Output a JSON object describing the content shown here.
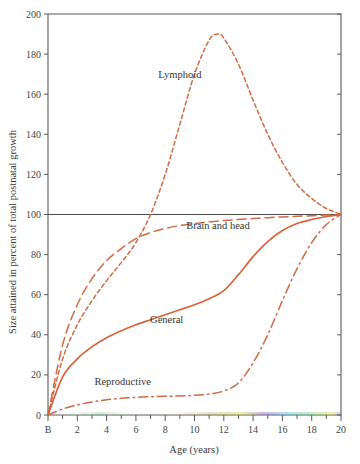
{
  "chart_data": {
    "type": "line",
    "title": "",
    "xlabel": "Age (years)",
    "ylabel": "Size attained in percent of total postnatal growth",
    "xlim": [
      0,
      20
    ],
    "ylim": [
      0,
      200
    ],
    "grid": false,
    "legend_position": "inline-labels",
    "x_tick_labels": [
      "B",
      "2",
      "4",
      "6",
      "8",
      "10",
      "12",
      "14",
      "16",
      "18",
      "20"
    ],
    "x_tick_values": [
      0,
      2,
      4,
      6,
      8,
      10,
      12,
      14,
      16,
      18,
      20
    ],
    "x_minor_tick_values": [
      1,
      3,
      5,
      7,
      9,
      11,
      13,
      15,
      17,
      19
    ],
    "y_tick_labels": [
      "0",
      "20",
      "40",
      "60",
      "80",
      "100",
      "120",
      "140",
      "160",
      "180",
      "200"
    ],
    "y_tick_values": [
      0,
      20,
      40,
      60,
      80,
      100,
      120,
      140,
      160,
      180,
      200
    ],
    "reference_line": {
      "y": 100,
      "style": "solid-dark",
      "label": ""
    },
    "series": [
      {
        "name": "Lymphoid",
        "label": "Lymphoid",
        "color": "#cf6a43",
        "dash": "short-dash",
        "x": [
          0,
          1,
          2,
          3,
          4,
          5,
          6,
          7,
          8,
          9,
          10,
          11,
          11.6,
          12,
          13,
          14,
          15,
          16,
          17,
          18,
          19,
          20
        ],
        "y": [
          0,
          28,
          45,
          57,
          67,
          76,
          86,
          100,
          120,
          145,
          170,
          187,
          190,
          188,
          175,
          157,
          140,
          126,
          115,
          108,
          103,
          100
        ]
      },
      {
        "name": "Brain and head",
        "label": "Brain and head",
        "color": "#cf6a43",
        "dash": "long-dash",
        "x": [
          0,
          1,
          2,
          3,
          4,
          5,
          6,
          7,
          8,
          9,
          10,
          11,
          12,
          13,
          14,
          15,
          16,
          17,
          18,
          19,
          20
        ],
        "y": [
          0,
          35,
          55,
          68,
          77,
          83,
          88,
          91,
          93,
          94.5,
          95.5,
          96.3,
          97,
          97.5,
          98,
          98.4,
          98.8,
          99.1,
          99.4,
          99.7,
          100
        ]
      },
      {
        "name": "General",
        "label": "General",
        "color": "#d8633b",
        "dash": "solid",
        "x": [
          0,
          1,
          2,
          3,
          4,
          5,
          6,
          7,
          8,
          9,
          10,
          11,
          12,
          13,
          14,
          15,
          16,
          17,
          18,
          19,
          20
        ],
        "y": [
          0,
          19,
          28,
          34,
          38.5,
          42,
          45,
          47.5,
          50,
          52.5,
          55,
          58,
          62,
          70,
          79,
          86.5,
          92,
          95.5,
          97.5,
          99,
          100
        ]
      },
      {
        "name": "Reproductive",
        "label": "Reproductive",
        "color": "#cf6a43",
        "dash": "dash-dot",
        "x": [
          0,
          1,
          2,
          3,
          4,
          5,
          6,
          7,
          8,
          9,
          10,
          11,
          12,
          13,
          14,
          15,
          16,
          17,
          18,
          19,
          20
        ],
        "y": [
          0,
          3,
          5,
          6.5,
          7.6,
          8.3,
          8.8,
          9.1,
          9.3,
          9.5,
          9.8,
          10.5,
          12,
          16,
          26,
          40,
          57,
          73,
          86,
          95,
          100
        ]
      }
    ],
    "annotations": [
      {
        "text": "Lymphoid",
        "x": 9.0,
        "y": 168
      },
      {
        "text": "Brain and head",
        "x": 11.6,
        "y": 93
      },
      {
        "text": "General",
        "x": 8.1,
        "y": 46
      },
      {
        "text": "Reproductive",
        "x": 5.1,
        "y": 15
      }
    ]
  }
}
